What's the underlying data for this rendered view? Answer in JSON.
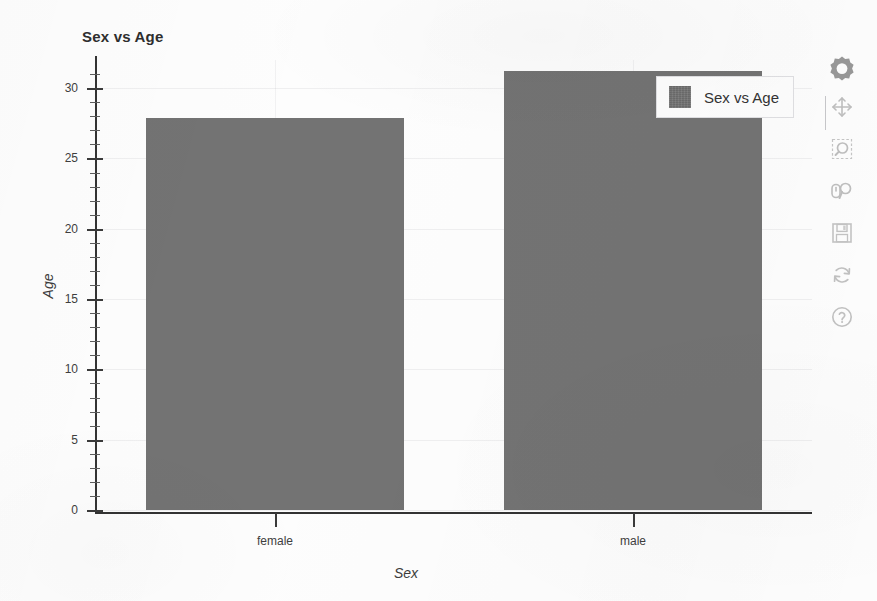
{
  "chart_data": {
    "type": "bar",
    "title": "Sex vs Age",
    "categories": [
      "female",
      "male"
    ],
    "values": [
      27.9,
      31.2
    ],
    "series": [
      {
        "name": "Sex vs Age",
        "values": [
          27.9,
          31.2
        ]
      }
    ],
    "xlabel": "Sex",
    "ylabel": "Age",
    "ylim": [
      0,
      32
    ],
    "yticks": [
      0,
      5,
      10,
      15,
      20,
      25,
      30
    ],
    "ytick_labels": [
      "0",
      "5",
      "10",
      "15",
      "20",
      "25",
      "30"
    ],
    "xtick_labels": [
      "female",
      "male"
    ],
    "grid": true,
    "legend_position": "top-right",
    "bar_color": "#737373",
    "minor_ticks": true
  },
  "legend": {
    "entries": [
      {
        "label": "Sex vs Age",
        "color": "#737373"
      }
    ]
  },
  "toolbar": {
    "items": [
      {
        "name": "bokeh-logo-icon",
        "label": "Bokeh"
      },
      {
        "name": "pan-tool-icon",
        "label": "Pan"
      },
      {
        "name": "box-zoom-tool-icon",
        "label": "Box Zoom"
      },
      {
        "name": "wheel-zoom-tool-icon",
        "label": "Wheel Zoom"
      },
      {
        "name": "save-tool-icon",
        "label": "Save"
      },
      {
        "name": "reset-tool-icon",
        "label": "Reset"
      },
      {
        "name": "help-tool-icon",
        "label": "Help"
      }
    ]
  },
  "colors": {
    "bar": "#737373",
    "axis": "#333333",
    "text": "#3e3e3e",
    "background": "#fdfdfd"
  }
}
